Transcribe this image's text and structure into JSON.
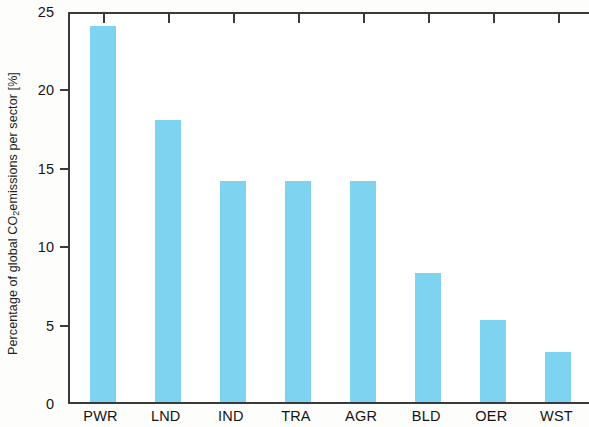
{
  "chart_data": {
    "type": "bar",
    "title": "",
    "subtitle": "",
    "xlabel": "",
    "ylabel": "Percentage of global CO2 emissions per sector [%]",
    "ylabel_parts": {
      "before": "Percentage of global CO",
      "subscript": "2",
      "after": " emissions per sector [%]"
    },
    "categories": [
      "PWR",
      "LND",
      "IND",
      "TRA",
      "AGR",
      "BLD",
      "OER",
      "WST"
    ],
    "values": [
      24.0,
      18.0,
      14.1,
      14.1,
      14.1,
      8.2,
      5.2,
      3.2
    ],
    "ylim": [
      0,
      25
    ],
    "yticks": [
      0,
      5,
      10,
      15,
      20,
      25
    ],
    "ytick_labels": [
      "0",
      "5",
      "10",
      "15",
      "20",
      "25"
    ],
    "grid": false,
    "legend": null,
    "bar_color": "#7ed3f0",
    "axis_color": "#3a3a3a",
    "background_color": "#fdfdfb"
  }
}
